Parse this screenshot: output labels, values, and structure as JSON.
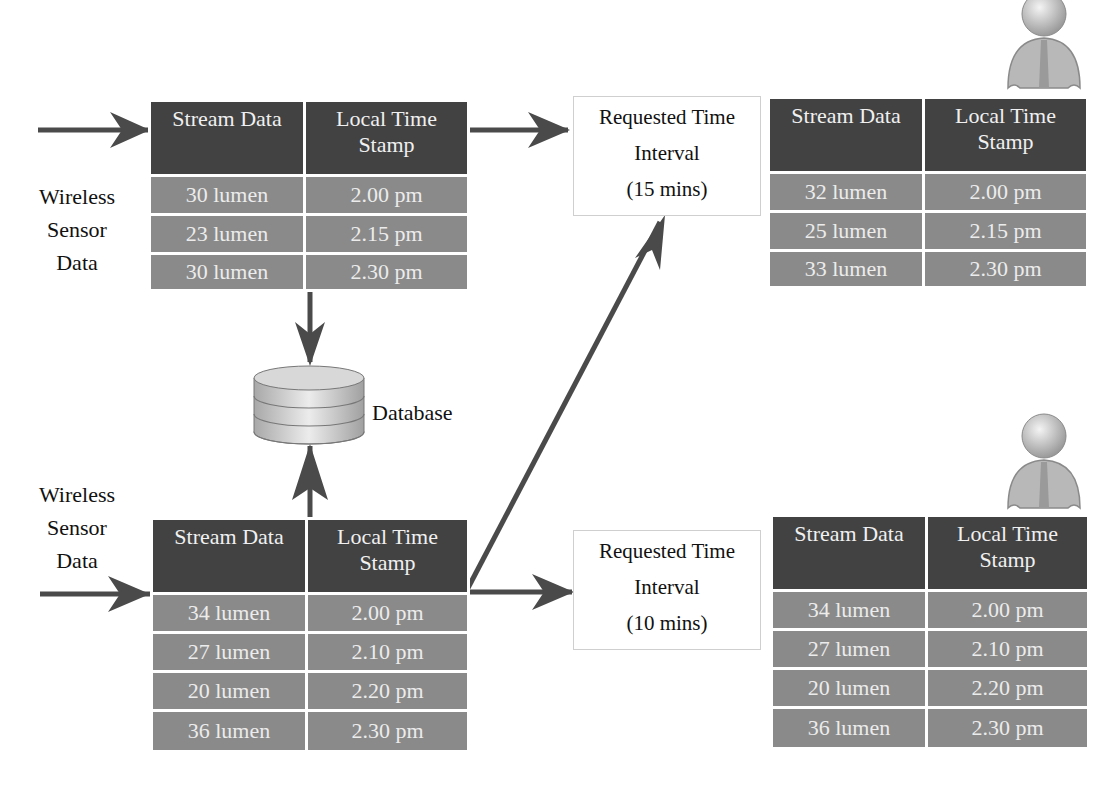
{
  "colors": {
    "header_bg": "#424242",
    "row_bg": "#8a8a8a",
    "arrow": "#4a4a4a",
    "cell_text": "#ececec"
  },
  "table_headers": {
    "stream": "Stream Data",
    "time_line1": "Local Time",
    "time_line2": "Stamp"
  },
  "sensor_label": {
    "line1": "Wireless",
    "line2": "Sensor",
    "line3": "Data"
  },
  "database_label": "Database",
  "sensor_top_table": {
    "rows": [
      {
        "stream": "30 lumen",
        "time": "2.00 pm"
      },
      {
        "stream": "23 lumen",
        "time": "2.15 pm"
      },
      {
        "stream": "30 lumen",
        "time": "2.30 pm"
      }
    ]
  },
  "sensor_bottom_table": {
    "rows": [
      {
        "stream": "34 lumen",
        "time": "2.00 pm"
      },
      {
        "stream": "27 lumen",
        "time": "2.10 pm"
      },
      {
        "stream": "20 lumen",
        "time": "2.20 pm"
      },
      {
        "stream": "36 lumen",
        "time": "2.30 pm"
      }
    ]
  },
  "request_top": {
    "line1": "Requested Time",
    "line2": "Interval",
    "line3": "(15 mins)"
  },
  "request_bottom": {
    "line1": "Requested Time",
    "line2": "Interval",
    "line3": "(10 mins)"
  },
  "user_top_table": {
    "rows": [
      {
        "stream": "32 lumen",
        "time": "2.00 pm"
      },
      {
        "stream": "25 lumen",
        "time": "2.15 pm"
      },
      {
        "stream": "33 lumen",
        "time": "2.30 pm"
      }
    ]
  },
  "user_bottom_table": {
    "rows": [
      {
        "stream": "34 lumen",
        "time": "2.00 pm"
      },
      {
        "stream": "27 lumen",
        "time": "2.10 pm"
      },
      {
        "stream": "20 lumen",
        "time": "2.20 pm"
      },
      {
        "stream": "36 lumen",
        "time": "2.30 pm"
      }
    ]
  }
}
